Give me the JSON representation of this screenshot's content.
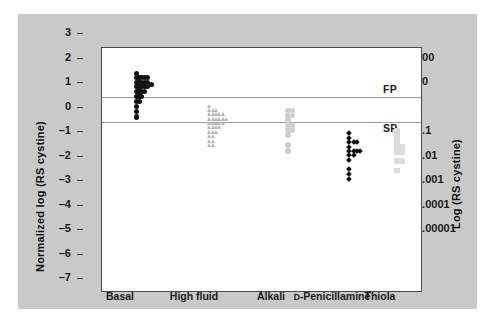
{
  "chart_data": {
    "type": "scatter",
    "title": "",
    "subtitle": "",
    "xlabel": "",
    "ylabel": "Normalized log (RS cystine)",
    "y2label": "Log (RS cystine)",
    "categories": [
      "Basal",
      "High fluid",
      "Alkali",
      "D-Penicillamine",
      "Thiola"
    ],
    "category_label_parts": [
      {
        "prefix": "",
        "main": "Basal"
      },
      {
        "prefix": "",
        "main": "High fluid"
      },
      {
        "prefix": "",
        "main": "Alkali"
      },
      {
        "prefix": "D",
        "main": "-Penicillamine"
      },
      {
        "prefix": "",
        "main": "Thiola"
      }
    ],
    "ylim": [
      -7,
      3
    ],
    "yticks": [
      3,
      2,
      1,
      0,
      -1,
      -2,
      -3,
      -4,
      -5,
      -6,
      -7
    ],
    "ytick_labels": [
      "3",
      "2",
      "1",
      "0",
      "-1",
      "-2",
      "-3",
      "-4",
      "-5",
      "-6",
      "-7"
    ],
    "y2ticks": [
      2,
      1,
      0,
      -1,
      -2,
      -3,
      -4,
      -5
    ],
    "y2tick_labels": [
      "100",
      "10",
      "1",
      "0.1",
      "0.01",
      "0.001",
      "0.0001",
      "0.00001"
    ],
    "grid": false,
    "legend": "none",
    "annotations": [
      {
        "text": "FP",
        "y": 1.28,
        "x_frac": 0.875,
        "note": "formation product reference"
      },
      {
        "text": "SP",
        "y": -0.32,
        "x_frac": 0.875,
        "note": "solubility product reference"
      }
    ],
    "reference_lines": [
      {
        "y": 1,
        "label": "FP",
        "color": "#9a9a9a"
      },
      {
        "y": 0,
        "label": "SP",
        "color": "#9a9a9a"
      }
    ],
    "series": [
      {
        "name": "Basal",
        "marker": "circle",
        "color": "#111111",
        "size": 5.2,
        "x_center_frac": 0.115,
        "points": [
          {
            "x": -0.5,
            "y": 1.95
          },
          {
            "x": -0.5,
            "y": 1.78
          },
          {
            "x": 0.0,
            "y": 1.78
          },
          {
            "x": 0.5,
            "y": 1.78
          },
          {
            "x": 1.0,
            "y": 1.78
          },
          {
            "x": 1.5,
            "y": 1.78
          },
          {
            "x": -0.5,
            "y": 1.6
          },
          {
            "x": 0.0,
            "y": 1.6
          },
          {
            "x": 0.5,
            "y": 1.6
          },
          {
            "x": 1.0,
            "y": 1.6
          },
          {
            "x": 1.5,
            "y": 1.6
          },
          {
            "x": 2.3,
            "y": 1.52
          },
          {
            "x": -0.5,
            "y": 1.42
          },
          {
            "x": 0.0,
            "y": 1.42
          },
          {
            "x": 0.5,
            "y": 1.42
          },
          {
            "x": 1.0,
            "y": 1.42
          },
          {
            "x": 1.5,
            "y": 1.42
          },
          {
            "x": -0.5,
            "y": 1.22
          },
          {
            "x": 0.0,
            "y": 1.22
          },
          {
            "x": 0.5,
            "y": 1.22
          },
          {
            "x": 1.0,
            "y": 1.22
          },
          {
            "x": -0.5,
            "y": 1.02
          },
          {
            "x": 0.0,
            "y": 1.02
          },
          {
            "x": 0.5,
            "y": 1.02
          },
          {
            "x": -0.5,
            "y": 0.82
          },
          {
            "x": 0.1,
            "y": 0.8
          },
          {
            "x": -0.5,
            "y": 0.6
          },
          {
            "x": -0.5,
            "y": 0.4
          },
          {
            "x": -0.4,
            "y": 0.18
          }
        ]
      },
      {
        "name": "High fluid",
        "marker": "triangle",
        "color": "#b6b6b6",
        "size": 5.4,
        "x_center_frac": 0.345,
        "points": [
          {
            "x": -0.5,
            "y": 0.62
          },
          {
            "x": -0.5,
            "y": 0.45
          },
          {
            "x": 0.1,
            "y": 0.45
          },
          {
            "x": 0.7,
            "y": 0.45
          },
          {
            "x": -0.5,
            "y": 0.28
          },
          {
            "x": 0.1,
            "y": 0.28
          },
          {
            "x": 0.7,
            "y": 0.28
          },
          {
            "x": 1.3,
            "y": 0.28
          },
          {
            "x": 1.9,
            "y": 0.28
          },
          {
            "x": -0.5,
            "y": 0.1
          },
          {
            "x": 0.1,
            "y": 0.1
          },
          {
            "x": 0.7,
            "y": 0.1
          },
          {
            "x": 1.3,
            "y": 0.1
          },
          {
            "x": 1.9,
            "y": 0.1
          },
          {
            "x": 2.5,
            "y": 0.1
          },
          {
            "x": -0.5,
            "y": -0.08
          },
          {
            "x": 0.1,
            "y": -0.08
          },
          {
            "x": 0.7,
            "y": -0.08
          },
          {
            "x": 1.3,
            "y": -0.08
          },
          {
            "x": 1.9,
            "y": -0.08
          },
          {
            "x": -0.5,
            "y": -0.26
          },
          {
            "x": 0.1,
            "y": -0.26
          },
          {
            "x": 0.7,
            "y": -0.26
          },
          {
            "x": 1.3,
            "y": -0.26
          },
          {
            "x": -0.5,
            "y": -0.44
          },
          {
            "x": 0.1,
            "y": -0.44
          },
          {
            "x": 0.7,
            "y": -0.44
          },
          {
            "x": -0.5,
            "y": -0.62
          },
          {
            "x": 0.1,
            "y": -0.62
          },
          {
            "x": -0.5,
            "y": -0.8
          },
          {
            "x": 0.1,
            "y": -0.8
          },
          {
            "x": -0.5,
            "y": -0.98
          },
          {
            "x": 0.1,
            "y": -0.98
          }
        ]
      },
      {
        "name": "Alkali",
        "marker": "circle",
        "color": "#cfcfcf",
        "size": 5.6,
        "x_center_frac": 0.585,
        "points": [
          {
            "x": -0.35,
            "y": 0.45
          },
          {
            "x": 0.45,
            "y": 0.45
          },
          {
            "x": -0.35,
            "y": 0.25
          },
          {
            "x": 0.45,
            "y": 0.25
          },
          {
            "x": -0.35,
            "y": 0.05
          },
          {
            "x": -0.35,
            "y": -0.15
          },
          {
            "x": 0.45,
            "y": -0.15
          },
          {
            "x": -0.35,
            "y": -0.35
          },
          {
            "x": 0.45,
            "y": -0.35
          },
          {
            "x": -0.35,
            "y": -0.55
          },
          {
            "x": -0.35,
            "y": -0.95
          },
          {
            "x": -0.35,
            "y": -1.2
          }
        ]
      },
      {
        "name": "D-Penicillamine",
        "marker": "diamond",
        "color": "#111111",
        "size": 3.8,
        "x_center_frac": 0.775,
        "points": [
          {
            "x": -0.3,
            "y": -0.48
          },
          {
            "x": -0.3,
            "y": -0.66
          },
          {
            "x": -0.3,
            "y": -0.84
          },
          {
            "x": 0.5,
            "y": -0.84
          },
          {
            "x": 1.1,
            "y": -0.84
          },
          {
            "x": -0.3,
            "y": -1.02
          },
          {
            "x": -0.3,
            "y": -1.2
          },
          {
            "x": 0.5,
            "y": -1.2
          },
          {
            "x": 1.1,
            "y": -1.2
          },
          {
            "x": 1.7,
            "y": -1.2
          },
          {
            "x": -0.3,
            "y": -1.38
          },
          {
            "x": 0.5,
            "y": -1.38
          },
          {
            "x": -0.3,
            "y": -1.56
          },
          {
            "x": -0.3,
            "y": -1.95
          },
          {
            "x": -0.3,
            "y": -2.15
          },
          {
            "x": -0.3,
            "y": -2.35
          }
        ]
      },
      {
        "name": "Thiola",
        "marker": "square",
        "color": "#dcdcdc",
        "size": 5.6,
        "x_center_frac": 0.925,
        "points": [
          {
            "x": -0.3,
            "y": -0.36
          },
          {
            "x": -0.3,
            "y": -0.6
          },
          {
            "x": -0.3,
            "y": -0.8
          },
          {
            "x": -0.3,
            "y": -1.05
          },
          {
            "x": 0.5,
            "y": -1.05
          },
          {
            "x": -0.3,
            "y": -1.25
          },
          {
            "x": 0.5,
            "y": -1.25
          },
          {
            "x": -0.3,
            "y": -1.62
          },
          {
            "x": 0.5,
            "y": -1.62
          },
          {
            "x": -0.3,
            "y": -2.0
          }
        ]
      }
    ]
  },
  "colors": {
    "panel_background": "#c9c9c9",
    "plot_background": "#ffffff",
    "axis": "#4a4a4a",
    "reference_line": "#9a9a9a",
    "basal": "#111111",
    "high_fluid": "#b6b6b6",
    "alkali": "#cfcfcf",
    "d_penicillamine": "#111111",
    "thiola": "#dcdcdc"
  }
}
